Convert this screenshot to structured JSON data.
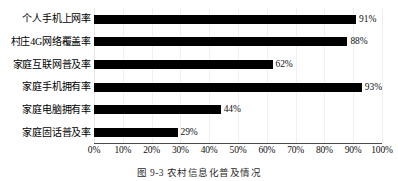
{
  "chart_data": {
    "type": "bar",
    "orientation": "horizontal",
    "title": "",
    "xlabel": "",
    "ylabel": "",
    "xlim": [
      0,
      100
    ],
    "grid": true,
    "legend": null,
    "categories": [
      "个人手机上网率",
      "村庄4G网络覆盖率",
      "家庭互联网普及率",
      "家庭手机拥有率",
      "家庭电脑拥有率",
      "家庭固话普及率"
    ],
    "values": [
      91,
      88,
      62,
      93,
      44,
      29
    ],
    "value_labels": [
      "91%",
      "88%",
      "62%",
      "93%",
      "44%",
      "29%"
    ],
    "xticks": [
      0,
      10,
      20,
      30,
      40,
      50,
      60,
      70,
      80,
      90,
      100
    ],
    "xtick_labels": [
      "0%",
      "10%",
      "20%",
      "30%",
      "40%",
      "50%",
      "60%",
      "70%",
      "80%",
      "90%",
      "100%"
    ],
    "bar_color": "#000000",
    "background_color": "#ffffff",
    "gridline_color": "#f0f0f0"
  },
  "caption": "图 9-3  农村信息化普及情况"
}
